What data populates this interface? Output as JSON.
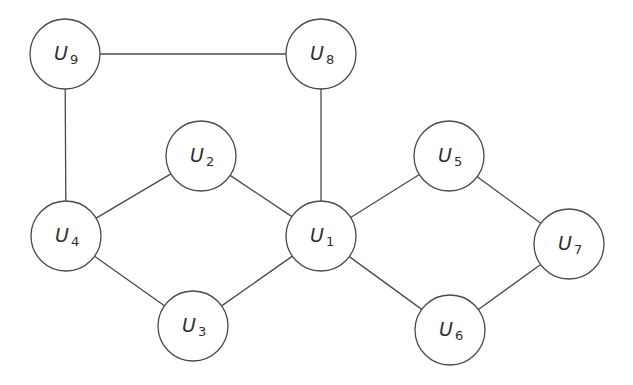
{
  "diagram": {
    "type": "undirected-graph",
    "node_radius": 35,
    "colors": {
      "stroke": "#4a4a4a",
      "label": "#2e2e2e",
      "node_fill": "#ffffff",
      "background": "#ffffff"
    },
    "nodes": [
      {
        "id": "U1",
        "var": "U",
        "sub": "1",
        "x": 321,
        "y": 236
      },
      {
        "id": "U2",
        "var": "U",
        "sub": "2",
        "x": 201,
        "y": 156
      },
      {
        "id": "U3",
        "var": "U",
        "sub": "3",
        "x": 193,
        "y": 326
      },
      {
        "id": "U4",
        "var": "U",
        "sub": "4",
        "x": 66,
        "y": 236
      },
      {
        "id": "U5",
        "var": "U",
        "sub": "5",
        "x": 449,
        "y": 156
      },
      {
        "id": "U6",
        "var": "U",
        "sub": "6",
        "x": 450,
        "y": 330
      },
      {
        "id": "U7",
        "var": "U",
        "sub": "7",
        "x": 569,
        "y": 244
      },
      {
        "id": "U8",
        "var": "U",
        "sub": "8",
        "x": 321,
        "y": 54
      },
      {
        "id": "U9",
        "var": "U",
        "sub": "9",
        "x": 65,
        "y": 54
      }
    ],
    "edges": [
      [
        "U9",
        "U8"
      ],
      [
        "U9",
        "U4"
      ],
      [
        "U8",
        "U1"
      ],
      [
        "U4",
        "U2"
      ],
      [
        "U2",
        "U1"
      ],
      [
        "U4",
        "U3"
      ],
      [
        "U3",
        "U1"
      ],
      [
        "U1",
        "U5"
      ],
      [
        "U5",
        "U7"
      ],
      [
        "U1",
        "U6"
      ],
      [
        "U6",
        "U7"
      ]
    ]
  }
}
